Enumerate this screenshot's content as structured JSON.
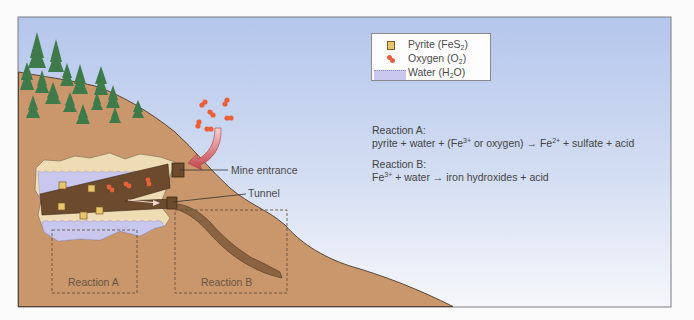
{
  "legend": {
    "items": [
      {
        "icon": "pyrite-cube-icon",
        "label_main": "Pyrite (FeS",
        "label_sub": "2",
        "label_end": ")",
        "color": "#e9c56b"
      },
      {
        "icon": "oxygen-molecule-icon",
        "label_main": "Oxygen (O",
        "label_sub": "2",
        "label_end": ")",
        "color": "#e8603a"
      },
      {
        "icon": "water-wave-icon",
        "label_main": "Water (H",
        "label_sub": "2",
        "label_end": "O)",
        "color": "#c9c7ee"
      }
    ]
  },
  "reactions": {
    "a": {
      "title": "Reaction A:",
      "p1": "pyrite + water + (Fe",
      "s1": "3+",
      "p2": " or oxygen) ",
      "arrow": "→",
      "p3": " Fe",
      "s2": "2+",
      "p4": " + sulfate + acid"
    },
    "b": {
      "title": "Reaction B:",
      "p1": "Fe",
      "s1": "3+",
      "p2": " + water ",
      "arrow": "→",
      "p3": " iron hydroxides + acid"
    }
  },
  "callouts": {
    "mine_entrance": "Mine entrance",
    "tunnel": "Tunnel"
  },
  "zones": {
    "a": "Reaction A",
    "b": "Reaction B"
  },
  "colors": {
    "sky_top": "#b6c8ec",
    "sky_bottom": "#f4f6fb",
    "hill": "#c9976b",
    "tree": "#3f7a4a",
    "tunnel": "#6b4a2e",
    "water": "#c9c7ee",
    "rock": "#eedcb4",
    "oxygen": "#e8603a",
    "arrow": "#c0474b"
  }
}
